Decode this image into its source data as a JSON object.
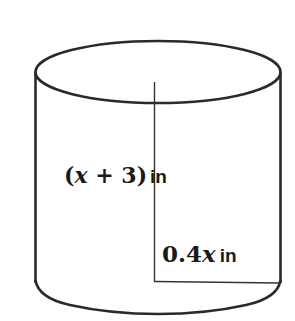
{
  "diagram": {
    "shape": "cylinder",
    "height_label": {
      "open_paren": "(",
      "variable": "x",
      "operator": " + ",
      "constant": "3",
      "close_paren": ")",
      "unit": "in"
    },
    "radius_label": {
      "coefficient": "0.4",
      "variable": "x",
      "unit": "in"
    },
    "colors": {
      "stroke": "#2a2a2a",
      "background": "#ffffff",
      "text": "#1a1a1a"
    }
  }
}
